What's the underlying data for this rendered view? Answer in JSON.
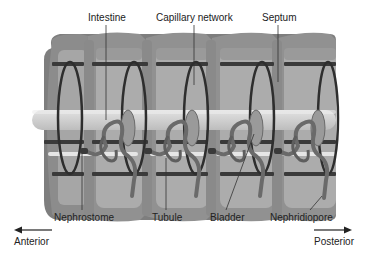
{
  "figure": {
    "segments": 5
  },
  "labels": {
    "intestine": "Intestine",
    "capillary_network": "Capillary network",
    "septum": "Septum",
    "nephrostome": "Nephrostome",
    "tubule": "Tubule",
    "bladder": "Bladder",
    "nephridiopore": "Nephridiopore"
  },
  "axis": {
    "anterior": "Anterior",
    "posterior": "Posterior"
  },
  "colors": {
    "body_outer": "#7a7a7a",
    "body_mid": "#9a9a9a",
    "body_inner": "#b5b5b5",
    "intestine": "#d2d2d2",
    "vessel_dark": "#2e2e2e",
    "tubule": "#6a6a6a",
    "highlight": "#ececec",
    "text": "#222222"
  }
}
